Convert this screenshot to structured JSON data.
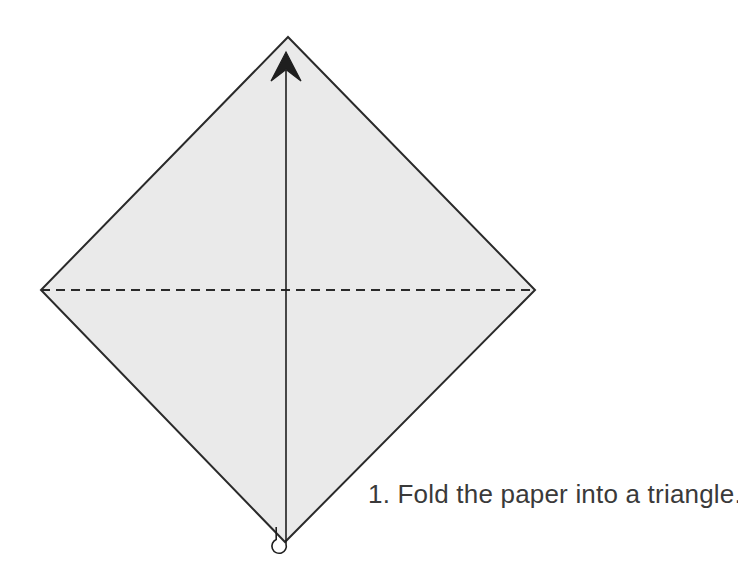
{
  "page": {
    "width": 738,
    "height": 563,
    "background_color": "#ffffff",
    "title": "Fold the paper into a triangle"
  },
  "instruction": {
    "step_number": "1",
    "caption": "1. Fold the paper into a triangle.",
    "text_color": "#3a3a3a",
    "font_size_px": 26
  },
  "diagram": {
    "kind": "origami-step",
    "paper": {
      "shape_name": "square-rotated-45",
      "fill_color": "#eaeaea",
      "stroke_color": "#2a2a2a",
      "stroke_width": 2,
      "points": "288,37 535,290 285,542 41,290",
      "vertices": {
        "top": {
          "x": 288,
          "y": 37
        },
        "right": {
          "x": 535,
          "y": 290
        },
        "bottom": {
          "x": 285,
          "y": 542
        },
        "left": {
          "x": 41,
          "y": 290
        }
      }
    },
    "fold_line": {
      "name": "horizontal-fold-line",
      "style": "dashed",
      "x1": 41,
      "y1": 290,
      "x2": 535,
      "y2": 290,
      "stroke_color": "#2a2a2a",
      "stroke_width": 2,
      "dash_pattern": "9 6"
    },
    "fold_arrow": {
      "name": "fold-direction-arrow",
      "direction": "up",
      "stroke_color": "#1f1f1f",
      "stroke_width": 1.6,
      "shaft_x": 286,
      "shaft_top_y": 72,
      "shaft_bottom_y": 536,
      "tail_hook_path": "M 286 536 L 286 543 A 7.5 7.5 0 1 1 276 538 L 276 528",
      "head_path": "M 286 52 L 300 80 L 286 70 L 272 80 Z",
      "head_tip": {
        "x": 286,
        "y": 52
      },
      "head_width": 28,
      "head_length": 28
    }
  }
}
